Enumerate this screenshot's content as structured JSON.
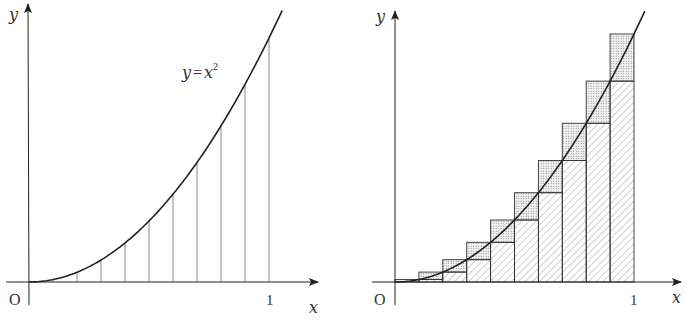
{
  "figures": [
    {
      "id": "left",
      "axis_labels": {
        "x": "x",
        "y": "y",
        "origin": "O",
        "tick_one": "1"
      },
      "curve_label": {
        "lhs": "y",
        "eq": "=",
        "base": "x",
        "exp": "2"
      },
      "function": "y = x^2",
      "partition_points": [
        0.1,
        0.2,
        0.3,
        0.4,
        0.5,
        0.6,
        0.7,
        0.8,
        0.9,
        1.0
      ],
      "description": "Parabola y=x^2 on [0,1] with vertical lines dividing into 10 equal strips"
    },
    {
      "id": "right",
      "axis_labels": {
        "x": "x",
        "y": "y",
        "origin": "O",
        "tick_one": "1"
      },
      "function": "y = x^2",
      "n": 10,
      "lower_rect_heights": [
        0,
        0.01,
        0.04,
        0.09,
        0.16,
        0.25,
        0.36,
        0.49,
        0.64,
        0.81
      ],
      "upper_rect_heights": [
        0.01,
        0.04,
        0.09,
        0.16,
        0.25,
        0.36,
        0.49,
        0.64,
        0.81,
        1.0
      ],
      "fills": {
        "lower": "diagonal-hatch",
        "upper": "dotted-stipple"
      },
      "description": "Lower (hatched) and upper (stippled) Riemann sum rectangles for y=x^2 on [0,1], n=10"
    }
  ],
  "colors": {
    "line": "#222222",
    "thin": "#555555",
    "stipple": "#888888",
    "hatch": "#777777"
  }
}
